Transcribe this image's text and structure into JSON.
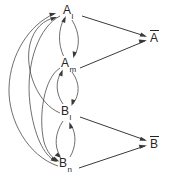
{
  "diagram": {
    "background_color": "#ffffff",
    "edge_color": "#4a4a4a",
    "text_color": "#262626",
    "nodes": [
      {
        "id": "A_l",
        "base": "A",
        "sub": "l",
        "overbar": false,
        "x": 68,
        "y": 10,
        "label_name": "node-label-a-l"
      },
      {
        "id": "A_m",
        "base": "A",
        "sub": "m",
        "overbar": false,
        "x": 64,
        "y": 63,
        "label_name": "node-label-a-m"
      },
      {
        "id": "B_l",
        "base": "B",
        "sub": "l",
        "overbar": false,
        "x": 64,
        "y": 111,
        "label_name": "node-label-b-l"
      },
      {
        "id": "B_n",
        "base": "B",
        "sub": "n",
        "overbar": false,
        "x": 62,
        "y": 163,
        "label_name": "node-label-b-n"
      },
      {
        "id": "A_bar",
        "base": "A",
        "sub": "",
        "overbar": true,
        "x": 152,
        "y": 32,
        "label_name": "node-label-a-bar"
      },
      {
        "id": "B_bar",
        "base": "B",
        "sub": "",
        "overbar": true,
        "x": 152,
        "y": 138,
        "label_name": "node-label-b-bar"
      }
    ],
    "edges": [
      {
        "from": "A_l",
        "to": "A_bar",
        "style": "straight",
        "name": "edge-a-l-to-a-bar"
      },
      {
        "from": "A_m",
        "to": "A_bar",
        "style": "straight",
        "name": "edge-a-m-to-a-bar"
      },
      {
        "from": "B_l",
        "to": "B_bar",
        "style": "straight",
        "name": "edge-b-l-to-b-bar"
      },
      {
        "from": "B_n",
        "to": "B_bar",
        "style": "straight",
        "name": "edge-b-n-to-b-bar"
      },
      {
        "from": "A_l",
        "to": "A_m",
        "style": "curved",
        "name": "edge-a-l-to-a-m"
      },
      {
        "from": "A_m",
        "to": "A_l",
        "style": "curved",
        "name": "edge-a-m-to-a-l"
      },
      {
        "from": "A_m",
        "to": "B_l",
        "style": "curved",
        "name": "edge-a-m-to-b-l"
      },
      {
        "from": "B_l",
        "to": "A_m",
        "style": "curved",
        "name": "edge-b-l-to-a-m"
      },
      {
        "from": "B_l",
        "to": "B_n",
        "style": "curved",
        "name": "edge-b-l-to-b-n"
      },
      {
        "from": "B_n",
        "to": "B_l",
        "style": "curved",
        "name": "edge-b-n-to-b-l"
      },
      {
        "from": "B_n",
        "to": "A_l",
        "style": "curved-long",
        "name": "edge-b-n-to-a-l"
      },
      {
        "from": "B_l",
        "to": "A_l",
        "style": "curved-long",
        "name": "edge-b-l-to-a-l"
      },
      {
        "from": "A_l",
        "to": "B_n",
        "style": "curved-long",
        "name": "edge-a-l-to-b-n"
      },
      {
        "from": "A_m",
        "to": "B_n",
        "style": "curved-long",
        "name": "edge-a-m-to-b-n"
      }
    ]
  }
}
